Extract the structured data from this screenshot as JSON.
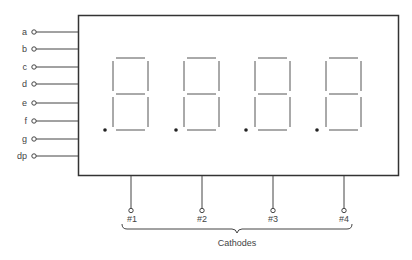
{
  "diagram": {
    "segment_pins": [
      "a",
      "b",
      "c",
      "d",
      "e",
      "f",
      "g",
      "dp"
    ],
    "cathode_pins": [
      "#1",
      "#2",
      "#3",
      "#4"
    ],
    "cathodes_label": "Cathodes",
    "digit_count": 4,
    "line_color": "#333333",
    "segment_color": "#555555"
  }
}
